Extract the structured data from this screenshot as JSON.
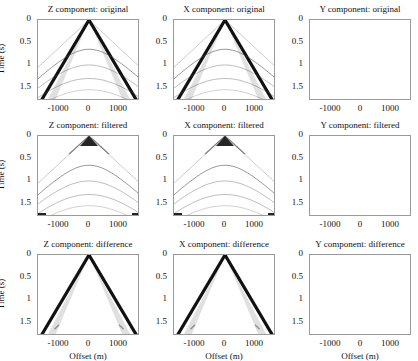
{
  "chart_data": {
    "type": "heatmap",
    "layout": {
      "rows": 3,
      "cols": 3,
      "colormap": "grayscale (white=0, black=max amplitude)"
    },
    "shared_axes": {
      "xlabel": "Offset (m)",
      "ylabel": "Time (s)",
      "xticks": [
        "-1000",
        "0",
        "1000"
      ],
      "yticks": [
        "0",
        "0.5",
        "1",
        "1.5"
      ],
      "xlim": [
        -1700,
        1700
      ],
      "ylim": [
        1.8,
        0
      ]
    },
    "panels": [
      {
        "row": 0,
        "col": 0,
        "title": "Z component: original",
        "content": "V-shaped direct arrival (strong) from apex at 0 s, plus faint hyperbolic reflections near 0.65 s, 1.0 s, 1.3 s"
      },
      {
        "row": 0,
        "col": 1,
        "title": "X component: original",
        "content": "V-shaped direct arrival (strong) plus faint hyperbolic reflections"
      },
      {
        "row": 0,
        "col": 2,
        "title": "Y component: original",
        "content": "empty"
      },
      {
        "row": 1,
        "col": 0,
        "title": "Z component: filtered",
        "content": "direct arrival removed; dark apex near 0 s; faint reflection hyperbolas retained"
      },
      {
        "row": 1,
        "col": 1,
        "title": "X component: filtered",
        "content": "direct arrival removed; dark apex near 0 s; faint reflection hyperbolas retained"
      },
      {
        "row": 1,
        "col": 2,
        "title": "Y component: filtered",
        "content": "empty"
      },
      {
        "row": 2,
        "col": 0,
        "title": "Z component: difference",
        "content": "strong V-shaped direct arrival only"
      },
      {
        "row": 2,
        "col": 1,
        "title": "X component: difference",
        "content": "strong V-shaped direct arrival only"
      },
      {
        "row": 2,
        "col": 2,
        "title": "Y component: difference",
        "content": "empty"
      }
    ]
  }
}
